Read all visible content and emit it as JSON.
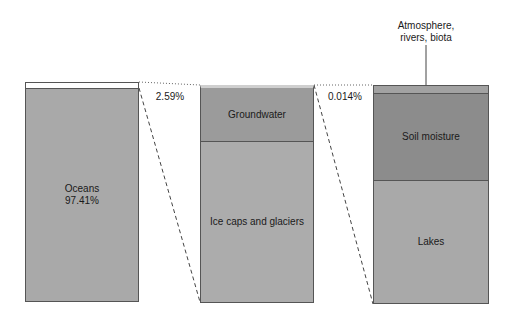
{
  "columns": [
    {
      "name": "total-water",
      "segments": [
        {
          "label": "",
          "value": "2.59%",
          "color": "#ffffff"
        },
        {
          "label": "Oceans",
          "value": "97.41%",
          "color": "#a9a9a9"
        }
      ]
    },
    {
      "name": "freshwater",
      "segments": [
        {
          "label": "Groundwater",
          "color": "#9b9b9b"
        },
        {
          "label": "Ice caps and glaciers",
          "color": "#acacac"
        }
      ]
    },
    {
      "name": "surface-freshwater",
      "segments": [
        {
          "label": "Atmosphere, rivers, biota",
          "color": "#a2a2a2"
        },
        {
          "label": "Soil moisture",
          "color": "#8c8c8c"
        },
        {
          "label": "Lakes",
          "color": "#a9a9a9"
        }
      ]
    }
  ],
  "connectors": [
    {
      "label": "2.59%"
    },
    {
      "label": "0.014%"
    }
  ],
  "callout": {
    "label_line1": "Atmosphere,",
    "label_line2": "rivers, biota"
  }
}
